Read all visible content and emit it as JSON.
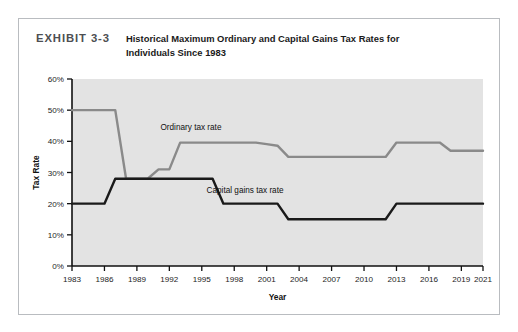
{
  "figure": {
    "exhibit_label": "EXHIBIT 3-3",
    "title_line1": "Historical Maximum Ordinary and Capital Gains Tax Rates for",
    "title_line2": "Individuals Since 1983"
  },
  "colors": {
    "plot_background": "#e3e3e3",
    "ordinary_line": "#8a8a8a",
    "capital_gains_line": "#1a1a1a",
    "axis": "#111111",
    "page_background": "#ffffff",
    "frame_border": "#b9bcc0",
    "exhibit_label_color": "#4d4f52"
  },
  "chart_data": {
    "type": "line",
    "title": "Historical Maximum Ordinary and Capital Gains Tax Rates for Individuals Since 1983",
    "xlabel": "Year",
    "ylabel": "Tax Rate",
    "xlim": [
      1983,
      2021
    ],
    "ylim": [
      0,
      60
    ],
    "ytick_labels": [
      "0%",
      "10%",
      "20%",
      "30%",
      "40%",
      "50%",
      "60%"
    ],
    "ytick_values": [
      0,
      10,
      20,
      30,
      40,
      50,
      60
    ],
    "xtick_labels": [
      "1983",
      "1986",
      "1989",
      "1992",
      "1995",
      "1998",
      "2001",
      "2004",
      "2007",
      "2010",
      "2013",
      "2016",
      "2019",
      "2021"
    ],
    "xtick_values": [
      1983,
      1986,
      1989,
      1992,
      1995,
      1998,
      2001,
      2004,
      2007,
      2010,
      2013,
      2016,
      2019,
      2021
    ],
    "grid": false,
    "legend_position": "inline-annotations",
    "series": [
      {
        "name": "Ordinary tax rate",
        "color": "#8a8a8a",
        "label_x": 1994,
        "label_y": 43.5,
        "points": [
          {
            "x": 1983,
            "y": 50
          },
          {
            "x": 1987,
            "y": 50
          },
          {
            "x": 1988,
            "y": 28
          },
          {
            "x": 1990,
            "y": 28
          },
          {
            "x": 1991,
            "y": 31
          },
          {
            "x": 1992,
            "y": 31
          },
          {
            "x": 1993,
            "y": 39.6
          },
          {
            "x": 2000,
            "y": 39.6
          },
          {
            "x": 2001,
            "y": 39.1
          },
          {
            "x": 2002,
            "y": 38.6
          },
          {
            "x": 2003,
            "y": 35
          },
          {
            "x": 2012,
            "y": 35
          },
          {
            "x": 2013,
            "y": 39.6
          },
          {
            "x": 2017,
            "y": 39.6
          },
          {
            "x": 2018,
            "y": 37
          },
          {
            "x": 2021,
            "y": 37
          }
        ]
      },
      {
        "name": "Capital gains tax rate",
        "color": "#1a1a1a",
        "label_x": 1999,
        "label_y": 23.5,
        "points": [
          {
            "x": 1983,
            "y": 20
          },
          {
            "x": 1986,
            "y": 20
          },
          {
            "x": 1987,
            "y": 28
          },
          {
            "x": 1996,
            "y": 28
          },
          {
            "x": 1997,
            "y": 20
          },
          {
            "x": 2002,
            "y": 20
          },
          {
            "x": 2003,
            "y": 15
          },
          {
            "x": 2012,
            "y": 15
          },
          {
            "x": 2013,
            "y": 20
          },
          {
            "x": 2021,
            "y": 20
          }
        ]
      }
    ]
  }
}
